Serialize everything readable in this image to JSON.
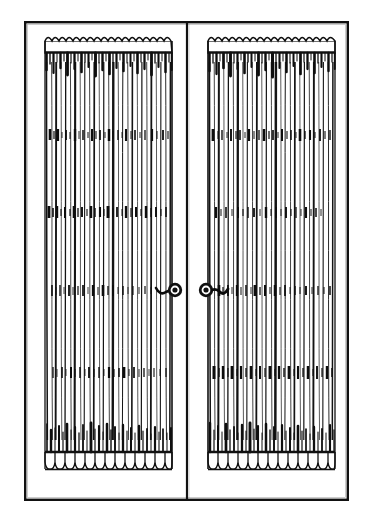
{
  "image": {
    "kind": "line-art-engraving",
    "subject": "pair-of-pleated-curtain-panels-with-tieback-rosettes",
    "caption": "Two gathered curtain panels hung side by side within a ruled rectangular border, each held by a spiral rosette holdback at mid-height.",
    "width": 369,
    "height": 526,
    "background_color": "#ffffff",
    "ink_color": "#101010"
  },
  "frame": {
    "name": "outer-border",
    "x": 25,
    "y": 22,
    "width": 323,
    "height": 478,
    "stroke_color": "#111111",
    "stroke_width": 2.4,
    "fill_color": "#ffffff"
  },
  "divider": {
    "name": "center-vertical-divider",
    "x": 187,
    "y_top": 22,
    "y_bottom": 500,
    "stroke_color": "#111111",
    "stroke_width": 2.2
  },
  "panels": [
    {
      "id": "left-panel",
      "label": "Left curtain panel",
      "x_left": 44,
      "x_right": 173,
      "y_top": 32,
      "y_bottom": 470,
      "heading_y_top": 32,
      "heading_y_bottom": 62,
      "hem_y_top": 440,
      "hem_y_bottom": 470,
      "pleat_count": 24,
      "scallop_count": 13,
      "tieback_side": "right"
    },
    {
      "id": "right-panel",
      "label": "Right curtain panel",
      "x_left": 207,
      "x_right": 336,
      "y_top": 32,
      "y_bottom": 470,
      "heading_y_top": 32,
      "heading_y_bottom": 62,
      "hem_y_top": 440,
      "hem_y_bottom": 470,
      "pleat_count": 24,
      "scallop_count": 13,
      "tieback_side": "left"
    }
  ],
  "pattern_bands": [
    {
      "id": "band-1",
      "y": 134,
      "height": 11,
      "label": "upper pattern band"
    },
    {
      "id": "band-2",
      "y": 212,
      "height": 11,
      "label": "second pattern band"
    },
    {
      "id": "band-3",
      "y": 290,
      "height": 11,
      "label": "third pattern band at tieback height"
    },
    {
      "id": "band-4",
      "y": 372,
      "height": 11,
      "label": "lower pattern band"
    }
  ],
  "hardware": [
    {
      "id": "left-rosette",
      "name": "spiral-rosette-holdback",
      "cx": 174,
      "cy": 290,
      "radius": 7.5,
      "arm_direction": "left",
      "arm_length": 16,
      "label": "Left tieback rosette"
    },
    {
      "id": "right-rosette",
      "name": "spiral-rosette-holdback",
      "cx": 207,
      "cy": 290,
      "radius": 7.5,
      "arm_direction": "right",
      "arm_length": 18,
      "label": "Right tieback rosette"
    }
  ]
}
